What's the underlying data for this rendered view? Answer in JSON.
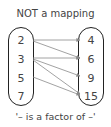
{
  "title": "NOT a mapping",
  "caption": "'– is a factor of –'",
  "domain_set": [
    "2",
    "3",
    "5",
    "7"
  ],
  "codomain_set": [
    "4",
    "6",
    "9",
    "15"
  ],
  "relations": [
    {
      "from": "2",
      "to": "4"
    },
    {
      "from": "2",
      "to": "6"
    },
    {
      "from": "3",
      "to": "6"
    },
    {
      "from": "3",
      "to": "9"
    },
    {
      "from": "3",
      "to": "15"
    },
    {
      "from": "5",
      "to": "15"
    }
  ],
  "colors": {
    "arrow": "#8a8a8a",
    "border": "#222222",
    "text": "#444444"
  }
}
